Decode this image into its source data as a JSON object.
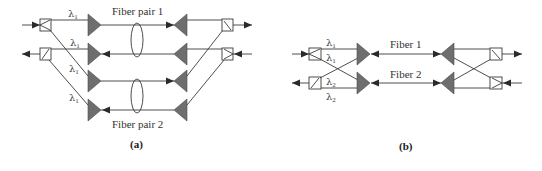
{
  "figure_a": {
    "caption": "(a)",
    "fiber_labels": [
      "Fiber pair 1",
      "Fiber pair 2"
    ],
    "wavelength_labels": [
      {
        "symbol": "λ",
        "sub": "1"
      },
      {
        "symbol": "λ",
        "sub": "1"
      },
      {
        "symbol": "λ",
        "sub": "1"
      },
      {
        "symbol": "λ",
        "sub": "1"
      }
    ]
  },
  "figure_b": {
    "caption": "(b)",
    "fiber_labels": [
      "Fiber 1",
      "Fiber 2"
    ],
    "wavelength_labels": [
      {
        "symbol": "λ",
        "sub": "1"
      },
      {
        "symbol": "λ",
        "sub": "1"
      },
      {
        "symbol": "λ",
        "sub": "2"
      },
      {
        "symbol": "λ",
        "sub": "2"
      }
    ]
  },
  "colors": {
    "amplifier_fill": "#6e6e6e",
    "line": "#3a3a3a",
    "background": "#ffffff"
  }
}
